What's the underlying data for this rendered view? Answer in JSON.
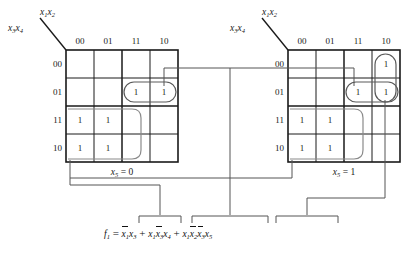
{
  "figure": {
    "kind": "karnaugh-map-pair",
    "axis_label_rows": "x3x4",
    "axis_label_cols": "x1x2",
    "column_headers": [
      "00",
      "01",
      "11",
      "10"
    ],
    "row_headers": [
      "00",
      "01",
      "11",
      "10"
    ]
  },
  "maps": [
    {
      "id": "left",
      "caption": "x5 = 0",
      "caption_var": "x",
      "caption_sub": "5",
      "caption_rest": " = 0",
      "cells": [
        [
          "",
          "",
          "",
          ""
        ],
        [
          "",
          "",
          "1",
          "1"
        ],
        [
          "1",
          "1",
          "",
          ""
        ],
        [
          "1",
          "1",
          "",
          ""
        ]
      ]
    },
    {
      "id": "right",
      "caption": "x5 = 1",
      "caption_var": "x",
      "caption_sub": "5",
      "caption_rest": " = 1",
      "cells": [
        [
          "",
          "",
          "",
          "1"
        ],
        [
          "",
          "",
          "1",
          "1"
        ],
        [
          "1",
          "1",
          "",
          ""
        ],
        [
          "1",
          "1",
          "",
          ""
        ]
      ]
    }
  ],
  "groups": [
    {
      "name": "left-row01-cols-11-10",
      "map": "left",
      "shape": "rounded-rect"
    },
    {
      "name": "left-rows-11-10-cols-00-01",
      "map": "left",
      "shape": "rounded-rect"
    },
    {
      "name": "right-row01-cols-11-10",
      "map": "right",
      "shape": "rounded-rect"
    },
    {
      "name": "right-col10-rows-00-01",
      "map": "right",
      "shape": "rounded-rect"
    },
    {
      "name": "right-rows-11-10-cols-00-01",
      "map": "right",
      "shape": "rounded-rect"
    }
  ],
  "equation": {
    "lhs_var": "f",
    "lhs_sub": "1",
    "eq_sign": "=",
    "terms": [
      {
        "id": "term-1",
        "factors": [
          {
            "var": "x",
            "sub": "1",
            "bar": true
          },
          {
            "var": "x",
            "sub": "3",
            "bar": false
          }
        ]
      },
      {
        "id": "term-2",
        "factors": [
          {
            "var": "x",
            "sub": "1",
            "bar": false
          },
          {
            "var": "x",
            "sub": "3",
            "bar": true
          },
          {
            "var": "x",
            "sub": "4",
            "bar": false
          }
        ]
      },
      {
        "id": "term-3",
        "factors": [
          {
            "var": "x",
            "sub": "1",
            "bar": false
          },
          {
            "var": "x",
            "sub": "2",
            "bar": true
          },
          {
            "var": "x",
            "sub": "3",
            "bar": true
          },
          {
            "var": "x",
            "sub": "5",
            "bar": false
          }
        ]
      }
    ],
    "plus": "+",
    "text_plain": "f1 = x1'x3 + x1x3'x4 + x1x2'x3'x5"
  },
  "colors": {
    "grid": "#1a1a1a",
    "group_outline": "#6e6e6e",
    "leader": "#6e6e6e",
    "text": "#1a1a1a",
    "background": "#ffffff"
  }
}
